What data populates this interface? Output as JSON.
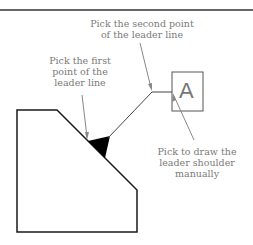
{
  "figure": {
    "labels": {
      "second_point": [
        "Pick the second point",
        "of the leader line"
      ],
      "first_point": [
        "Pick the first",
        "point of the",
        "leader line"
      ],
      "shoulder": [
        "Pick to draw the",
        "leader shoulder",
        "manually"
      ]
    },
    "datum_letter": "A",
    "colors": {
      "part_outline": "#1a1a1a",
      "leader": "#555555",
      "callout": "#888888",
      "text": "#7a7a7a",
      "rule": "#333333"
    }
  }
}
